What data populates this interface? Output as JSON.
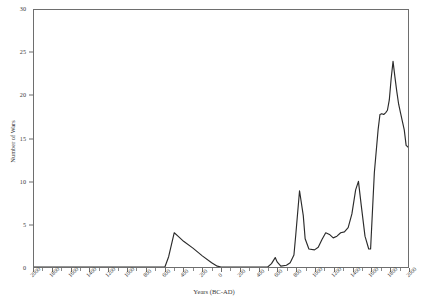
{
  "chart_data": {
    "type": "line",
    "title": "",
    "xlabel": "Years (BC-AD)",
    "ylabel": "Number of Wars",
    "xlim": [
      -2000,
      2000
    ],
    "ylim": [
      0,
      30
    ],
    "grid": false,
    "legend": "none",
    "ytick_labels": [
      "0",
      "5",
      "10",
      "15",
      "20",
      "25",
      "30"
    ],
    "ytick_values": [
      0,
      5,
      10,
      15,
      20,
      25,
      30
    ],
    "xtick_labels": [
      "2000",
      "1800",
      "1600",
      "1400",
      "1200",
      "1000",
      "800",
      "600",
      "400",
      "200",
      "0",
      "200",
      "400",
      "600",
      "800",
      "1000",
      "1200",
      "1400",
      "1600",
      "1800",
      "2000"
    ],
    "xtick_values": [
      -2000,
      -1800,
      -1600,
      -1400,
      -1200,
      -1000,
      -800,
      -600,
      -400,
      -200,
      0,
      200,
      400,
      600,
      800,
      1000,
      1200,
      1400,
      1600,
      1800,
      2000
    ],
    "series": [
      {
        "name": "Number of Wars",
        "color": "#2b2b2b",
        "x": [
          -2000,
          -1800,
          -1600,
          -1400,
          -1200,
          -1000,
          -800,
          -700,
          -640,
          -600,
          -560,
          -500,
          -460,
          -400,
          -300,
          -200,
          -100,
          -40,
          0,
          40,
          100,
          160,
          200,
          240,
          280,
          300,
          340,
          380,
          420,
          460,
          500,
          540,
          580,
          600,
          640,
          700,
          740,
          780,
          800,
          840,
          880,
          900,
          940,
          1000,
          1040,
          1080,
          1120,
          1160,
          1200,
          1240,
          1280,
          1320,
          1360,
          1400,
          1440,
          1470,
          1500,
          1540,
          1580,
          1600,
          1640,
          1680,
          1700,
          1720,
          1740,
          1760,
          1780,
          1800,
          1820,
          1840,
          1860,
          1880,
          1900,
          1920,
          1940,
          1960,
          1980,
          2000
        ],
        "y": [
          0,
          0,
          0,
          0,
          0,
          0,
          0,
          0,
          0,
          0,
          1.2,
          4.0,
          3.6,
          3.0,
          2.2,
          1.3,
          0.5,
          0.1,
          0,
          0,
          0,
          0,
          0,
          0,
          0,
          0,
          0,
          0,
          0,
          0,
          0,
          0.4,
          1.1,
          0.6,
          0.1,
          0.2,
          0.5,
          1.4,
          3.8,
          8.9,
          6.0,
          3.3,
          2.1,
          2.0,
          2.3,
          3.2,
          4.0,
          3.8,
          3.4,
          3.6,
          4.0,
          4.1,
          4.6,
          6.2,
          9.0,
          10.0,
          7.2,
          3.6,
          2.1,
          2.1,
          11.0,
          16.0,
          17.8,
          17.9,
          17.8,
          18.0,
          18.3,
          19.5,
          22.0,
          24.0,
          22.2,
          20.5,
          19.0,
          18.0,
          17.0,
          16.0,
          14.2,
          14.0
        ]
      }
    ],
    "colors": {
      "line": "#2b2b2b",
      "axis": "#6e6e6e",
      "text": "#3a3a3a",
      "background": "#ffffff"
    }
  }
}
